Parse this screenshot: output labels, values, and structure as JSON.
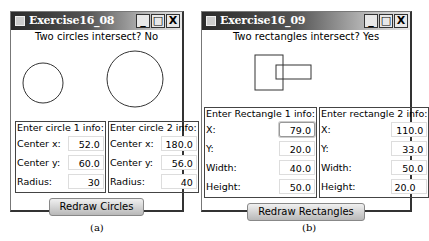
{
  "windows": [
    {
      "title": "Exercise16_08",
      "status": "Two circles intersect? No",
      "panels": [
        {
          "title": "Enter circle 1 info:",
          "fields": [
            {
              "label": "Center x:",
              "value": "52.0"
            },
            {
              "label": "Center y:",
              "value": "60.0"
            },
            {
              "label": "Radius:",
              "value": "30"
            }
          ]
        },
        {
          "title": "Enter circle 2 info:",
          "fields": [
            {
              "label": "Center x:",
              "value": "180.0"
            },
            {
              "label": "Center y:",
              "value": "56.0"
            },
            {
              "label": "Radius:",
              "value": "40"
            }
          ]
        }
      ],
      "button": "Redraw Circles",
      "caption": "(a)"
    },
    {
      "title": "Exercise16_09",
      "status": "Two rectangles intersect? Yes",
      "panels": [
        {
          "title": "Enter Rectangle 1 info:",
          "fields": [
            {
              "label": "X:",
              "value": "79.0"
            },
            {
              "label": "Y:",
              "value": "20.0"
            },
            {
              "label": "Width:",
              "value": "40.0"
            },
            {
              "label": "Height:",
              "value": "50.0"
            }
          ]
        },
        {
          "title": "Enter rectangle 2 info:",
          "fields": [
            {
              "label": "X:",
              "value": "110.0"
            },
            {
              "label": "Y:",
              "value": "33.0"
            },
            {
              "label": "Width:",
              "value": "50.0"
            },
            {
              "label": "Height:",
              "value": "20.0"
            }
          ]
        }
      ],
      "button": "Redraw Rectangles",
      "caption": "(b)"
    }
  ],
  "window_controls": {
    "minimize": "_",
    "maximize": "□",
    "close": "X"
  }
}
